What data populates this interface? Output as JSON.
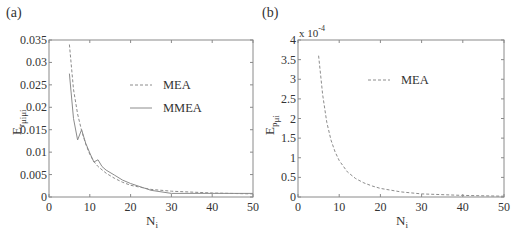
{
  "chart_data": [
    {
      "type": "line",
      "panel": "(a)",
      "title": "",
      "xlabel": "N_i",
      "ylabel": "E_{r_{μ_iμ_i}}",
      "xlim": [
        0,
        50
      ],
      "ylim": [
        0,
        0.035
      ],
      "xticks": [
        "0",
        "10",
        "20",
        "30",
        "40",
        "50"
      ],
      "yticks": [
        "0",
        "0.005",
        "0.01",
        "0.015",
        "0.02",
        "0.025",
        "0.03",
        "0.035"
      ],
      "grid": false,
      "legend_position": "upper center",
      "series": [
        {
          "name": "MEA",
          "style": "dashed",
          "x": [
            5,
            6,
            7,
            8,
            9,
            10,
            11,
            12,
            14,
            16,
            18,
            20,
            25,
            30,
            40,
            50
          ],
          "y": [
            0.034,
            0.024,
            0.0185,
            0.0148,
            0.0118,
            0.0095,
            0.0079,
            0.0068,
            0.0053,
            0.0042,
            0.0033,
            0.0026,
            0.0017,
            0.0013,
            0.0009,
            0.0007
          ]
        },
        {
          "name": "MMEA",
          "style": "solid",
          "x": [
            5,
            6,
            7,
            8,
            9,
            10,
            11,
            12,
            13,
            14,
            16,
            18,
            20,
            25,
            30,
            40,
            50
          ],
          "y": [
            0.0275,
            0.0175,
            0.0127,
            0.015,
            0.012,
            0.0098,
            0.0078,
            0.0083,
            0.0068,
            0.006,
            0.0049,
            0.0038,
            0.003,
            0.0015,
            0.0008,
            0.0008,
            0.0008
          ]
        }
      ]
    },
    {
      "type": "line",
      "panel": "(b)",
      "title": "",
      "xlabel": "N_i",
      "ylabel": "E_{p_{μ_i}}",
      "xlim": [
        0,
        50
      ],
      "ylim": [
        0,
        4
      ],
      "y_multiplier": "x 10^-4",
      "xticks": [
        "0",
        "10",
        "20",
        "30",
        "40",
        "50"
      ],
      "yticks": [
        "0",
        "0.5",
        "1",
        "1.5",
        "2",
        "2.5",
        "3",
        "3.5",
        "4"
      ],
      "grid": false,
      "legend_position": "upper center",
      "series": [
        {
          "name": "MEA",
          "style": "dashed",
          "x": [
            5,
            6,
            7,
            8,
            9,
            10,
            12,
            14,
            16,
            18,
            20,
            25,
            30,
            40,
            50
          ],
          "y": [
            3.6,
            2.6,
            1.9,
            1.45,
            1.15,
            0.93,
            0.64,
            0.47,
            0.36,
            0.28,
            0.22,
            0.13,
            0.08,
            0.04,
            0.02
          ]
        }
      ]
    }
  ],
  "panels": {
    "a": {
      "label": "(a)",
      "legend": [
        "MEA",
        "MMEA"
      ],
      "xlabel_main": "N",
      "xlabel_sub": "i",
      "ylabel_main": "E",
      "ylabel_sub": "r",
      "ylabel_subsub": "μiμi"
    },
    "b": {
      "label": "(b)",
      "legend": [
        "MEA"
      ],
      "multiplier_base": "x 10",
      "multiplier_exp": "-4",
      "xlabel_main": "N",
      "xlabel_sub": "i",
      "ylabel_main": "E",
      "ylabel_sub": "p",
      "ylabel_subsub": "μi"
    }
  },
  "colors": {
    "axis": "#8a8a8a",
    "line": "#8c8c8c",
    "text": "#333333"
  }
}
